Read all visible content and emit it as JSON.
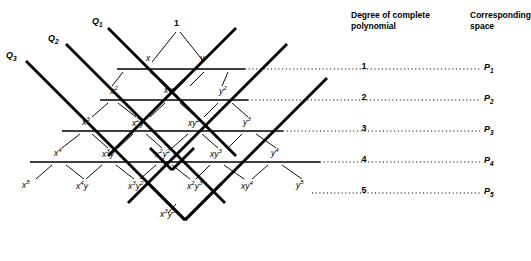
{
  "headers": {
    "degree": "Degree of complete\npolynomial",
    "space": "Corresponding\nspace"
  },
  "axis_labels": [
    {
      "name": "Q1",
      "text": "Q",
      "sub": "1",
      "x": 92,
      "y": 22
    },
    {
      "name": "Q2",
      "text": "Q",
      "sub": "2",
      "x": 48,
      "y": 38
    },
    {
      "name": "Q3",
      "text": "Q",
      "sub": "3",
      "x": 8,
      "y": 55
    }
  ],
  "apex": {
    "label": "1",
    "x": 174,
    "y": 22
  },
  "rows": [
    {
      "degree": "1",
      "space_text": "P",
      "space_sub": "1",
      "degree_x": 363,
      "space_x": 484,
      "line_y": 69,
      "solid_x1": 117,
      "solid_x2": 245,
      "dotted_x2": 481,
      "terms": [
        {
          "text": "x",
          "sup": "",
          "x": 146,
          "y": 57
        },
        {
          "text": "y",
          "sup": "",
          "x": 200,
          "y": 57
        }
      ]
    },
    {
      "degree": "2",
      "space_text": "P",
      "space_sub": "2",
      "degree_x": 363,
      "space_x": 484,
      "line_y": 100,
      "solid_x1": 100,
      "solid_x2": 248,
      "dotted_x2": 481,
      "terms": [
        {
          "text": "x",
          "sup": "2",
          "x": 112,
          "y": 88
        },
        {
          "text": "xy",
          "sup": "",
          "x": 166,
          "y": 89
        },
        {
          "text": "y",
          "sup": "2",
          "x": 220,
          "y": 88
        }
      ]
    },
    {
      "degree": "3",
      "space_text": "P",
      "space_sub": "3",
      "degree_x": 363,
      "space_x": 484,
      "line_y": 131,
      "solid_x1": 62,
      "solid_x2": 283,
      "dotted_x2": 481,
      "terms": [
        {
          "text": "x",
          "sup": "3",
          "x": 84,
          "y": 119
        },
        {
          "text": "x",
          "sup": "2",
          "x2": "y",
          "x": 134,
          "y": 120
        },
        {
          "text": "xy",
          "sup": "2",
          "x": 190,
          "y": 120
        },
        {
          "text": "y",
          "sup": "3",
          "x": 244,
          "y": 119
        }
      ]
    },
    {
      "degree": "4",
      "space_text": "P",
      "space_sub": "4",
      "degree_x": 363,
      "space_x": 484,
      "line_y": 162,
      "solid_x1": 30,
      "solid_x2": 320,
      "dotted_x2": 481,
      "terms": [
        {
          "text": "x",
          "sup": "4",
          "x": 56,
          "y": 150
        },
        {
          "text": "x",
          "sup": "3",
          "x2": "y",
          "x": 104,
          "y": 151
        },
        {
          "text": "x",
          "sup": "2",
          "x2": "y",
          "sup2": "2",
          "x": 157,
          "y": 151
        },
        {
          "text": "xy",
          "sup": "3",
          "x": 212,
          "y": 151
        },
        {
          "text": "y",
          "sup": "4",
          "x": 272,
          "y": 150
        }
      ]
    },
    {
      "degree": "5",
      "space_text": "P",
      "space_sub": "5",
      "degree_x": 363,
      "space_x": 484,
      "line_y": 193,
      "solid_x1": 0,
      "solid_x2": 0,
      "dotted_x2": 481,
      "dotted_x1": 298,
      "terms": [
        {
          "text": "x",
          "sup": "5",
          "x": 24,
          "y": 182
        },
        {
          "text": "x",
          "sup": "4",
          "x2": "y",
          "x": 78,
          "y": 183
        },
        {
          "text": "x",
          "sup": "3",
          "x2": "y",
          "sup2": "2",
          "x": 130,
          "y": 183
        },
        {
          "text": "x",
          "sup": "2",
          "x2": "y",
          "sup2": "3",
          "x": 189,
          "y": 183
        },
        {
          "text": "xy",
          "sup": "4",
          "x": 243,
          "y": 183
        },
        {
          "text": "y",
          "sup": "5",
          "x": 298,
          "y": 182
        }
      ]
    }
  ],
  "bottom_term": {
    "text": "x",
    "sup": "3",
    "x2": "y",
    "sup2": "3",
    "x": 162,
    "y": 211
  },
  "colors": {
    "stroke": "#000000",
    "background": "#ffffff"
  },
  "geometry": {
    "thick_width": 2.8,
    "thin_width": 0.9,
    "line_width": 1.3,
    "dot_width": 1.1
  }
}
